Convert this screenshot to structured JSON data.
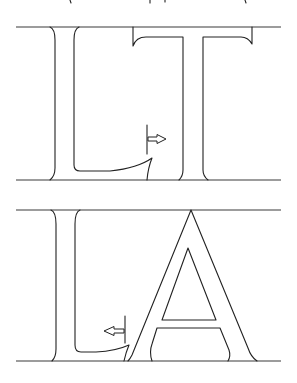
{
  "figure": {
    "panels": [
      {
        "id": "LT",
        "letters": [
          "L",
          "T"
        ],
        "arrow_direction": "right",
        "guide_top_y": 27,
        "guide_bottom_y": 180
      },
      {
        "id": "LA",
        "letters": [
          "L",
          "A"
        ],
        "arrow_direction": "left",
        "guide_top_y": 210,
        "guide_bottom_y": 361
      }
    ],
    "colors": {
      "stroke": "#222222",
      "background": "#ffffff"
    }
  }
}
